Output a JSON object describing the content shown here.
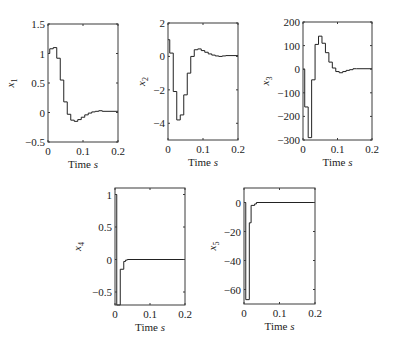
{
  "chart_data": [
    {
      "type": "line",
      "title": "",
      "xlabel": "Time s",
      "ylabel": "x1",
      "xlim": [
        0,
        0.2
      ],
      "ylim": [
        -0.5,
        1.5
      ],
      "xticks": [
        "0",
        "0.1",
        "0.2"
      ],
      "yticks": [
        "1.5",
        "1",
        "0.5",
        "0",
        "-0.5"
      ],
      "ytick_values": [
        1.5,
        1,
        0.5,
        0,
        -0.5
      ],
      "step": true,
      "x": [
        0,
        0.005,
        0.015,
        0.025,
        0.035,
        0.045,
        0.055,
        0.065,
        0.075,
        0.085,
        0.095,
        0.105,
        0.115,
        0.125,
        0.135,
        0.145,
        0.155,
        0.2
      ],
      "values": [
        1.0,
        1.08,
        1.1,
        0.92,
        0.55,
        0.18,
        -0.03,
        -0.13,
        -0.15,
        -0.12,
        -0.08,
        -0.04,
        -0.01,
        0.01,
        0.02,
        0.03,
        0.02,
        0.02
      ],
      "box": [
        48,
        24,
        118,
        142
      ]
    },
    {
      "type": "line",
      "title": "",
      "xlabel": "Time s",
      "ylabel": "x2",
      "xlim": [
        0,
        0.2
      ],
      "ylim": [
        -5,
        2
      ],
      "xticks": [
        "0",
        "0.1",
        "0.2"
      ],
      "yticks": [
        "2",
        "0",
        "-2",
        "-4"
      ],
      "ytick_values": [
        2,
        0,
        -2,
        -4
      ],
      "step": true,
      "x": [
        0,
        0.005,
        0.015,
        0.025,
        0.035,
        0.045,
        0.055,
        0.065,
        0.075,
        0.085,
        0.095,
        0.105,
        0.115,
        0.125,
        0.135,
        0.145,
        0.155,
        0.165,
        0.2
      ],
      "values": [
        1.0,
        0.2,
        -2.1,
        -3.8,
        -3.5,
        -2.3,
        -1.0,
        0.0,
        0.4,
        0.45,
        0.35,
        0.25,
        0.15,
        0.08,
        0.03,
        0.0,
        0.03,
        0.05,
        0.05
      ],
      "box": [
        168,
        23,
        238,
        140
      ]
    },
    {
      "type": "line",
      "title": "",
      "xlabel": "Time s",
      "ylabel": "x3",
      "xlim": [
        0,
        0.2
      ],
      "ylim": [
        -300,
        200
      ],
      "xticks": [
        "0",
        "0.1",
        "0.2"
      ],
      "yticks": [
        "200",
        "100",
        "0",
        "-100",
        "-200",
        "-300"
      ],
      "ytick_values": [
        200,
        100,
        0,
        -100,
        -200,
        -300
      ],
      "step": true,
      "x": [
        0,
        0.005,
        0.015,
        0.025,
        0.035,
        0.045,
        0.055,
        0.065,
        0.075,
        0.085,
        0.095,
        0.105,
        0.115,
        0.125,
        0.135,
        0.145,
        0.155,
        0.2
      ],
      "values": [
        0,
        -160,
        -290,
        -45,
        105,
        140,
        110,
        70,
        30,
        5,
        -10,
        -15,
        -10,
        -5,
        -2,
        2,
        2,
        2
      ],
      "box": [
        303,
        22,
        372,
        140
      ]
    },
    {
      "type": "line",
      "title": "",
      "xlabel": "Time s",
      "ylabel": "x4",
      "xlim": [
        0,
        0.2
      ],
      "ylim": [
        -0.7,
        1.1
      ],
      "xticks": [
        "0",
        "0.1",
        "0.2"
      ],
      "yticks": [
        "1",
        "0.5",
        "0",
        "-0.5"
      ],
      "ytick_values": [
        1,
        0.5,
        0,
        -0.5
      ],
      "step": true,
      "x": [
        0,
        0.005,
        0.015,
        0.025,
        0.03,
        0.035,
        0.2
      ],
      "values": [
        1.0,
        -0.7,
        -0.15,
        -0.03,
        -0.01,
        0.0,
        0.0
      ],
      "box": [
        115,
        188,
        185,
        305
      ]
    },
    {
      "type": "line",
      "title": "",
      "xlabel": "Time s",
      "ylabel": "x5",
      "xlim": [
        0,
        0.2
      ],
      "ylim": [
        -70,
        10
      ],
      "xticks": [
        "0",
        "0.1",
        "0.2"
      ],
      "yticks": [
        "0",
        "-20",
        "-40",
        "-60"
      ],
      "ytick_values": [
        0,
        -20,
        -40,
        -60
      ],
      "step": true,
      "x": [
        0,
        0.005,
        0.015,
        0.02,
        0.03,
        0.035,
        0.2
      ],
      "values": [
        0,
        -67,
        -14,
        -2,
        -1,
        0,
        0
      ],
      "box": [
        244,
        188,
        315,
        304
      ]
    }
  ],
  "labels": {
    "xlabel_main": "Time ",
    "xlabel_unit": "s"
  }
}
